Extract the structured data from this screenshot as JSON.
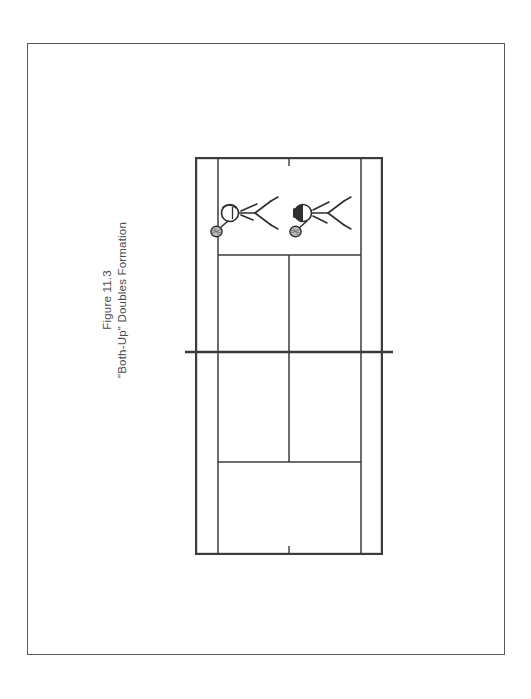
{
  "page": {
    "background_color": "#ffffff",
    "border_color": "#58595b",
    "width": 531,
    "height": 699
  },
  "caption": {
    "figure_number": "Figure 11.3",
    "title": "\"Both-Up\" Doubles Formation",
    "orientation": "rotated-90-ccw",
    "text_color": "#4b4c4e"
  },
  "diagram": {
    "kind": "tennis-court-diagram",
    "line_color": "#3a3b3d",
    "court": {
      "doubles_sideline_left": "doubles-sideline-left",
      "doubles_sideline_right": "doubles-sideline-right",
      "singles_sideline_left": "singles-sideline-left",
      "singles_sideline_right": "singles-sideline-right",
      "baseline_top": "baseline-top",
      "baseline_bottom": "baseline-bottom",
      "service_line_far": "service-line-far",
      "service_line_near": "service-line-near",
      "center_service_line": "center-service-line",
      "center_mark_top": "center-mark-top",
      "center_mark_bottom": "center-mark-bottom",
      "net": "net-line"
    },
    "players": [
      {
        "id": "player-left",
        "label": "Net player, deuce side",
        "position": "both-up-left",
        "facing": "right",
        "has_racket": true,
        "has_ball": true
      },
      {
        "id": "player-right",
        "label": "Net player, ad side",
        "position": "both-up-right",
        "facing": "right",
        "has_racket": true,
        "has_ball": true
      }
    ]
  }
}
